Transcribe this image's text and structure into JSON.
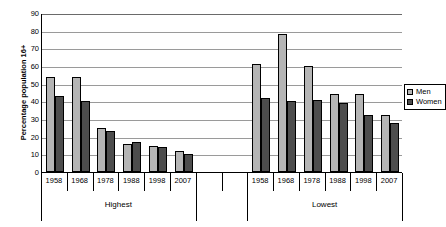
{
  "chart_data": {
    "type": "bar",
    "title": "",
    "xlabel": "",
    "ylabel": "Percentage population 16+",
    "ylim": [
      0,
      90
    ],
    "ytick_step": 10,
    "yticks": [
      0,
      10,
      20,
      30,
      40,
      50,
      60,
      70,
      80,
      90
    ],
    "grid": true,
    "legend_position": "right",
    "groups": [
      "Highest",
      "Lowest"
    ],
    "categories": [
      "1958",
      "1968",
      "1978",
      "1988",
      "1998",
      "2007"
    ],
    "series": [
      {
        "name": "Men",
        "color": "#b5b5b5",
        "values_by_group": {
          "Highest": [
            54,
            54,
            25,
            16,
            15,
            12
          ],
          "Lowest": [
            61,
            78,
            60,
            44,
            44,
            32
          ]
        }
      },
      {
        "name": "Women",
        "color": "#4d4d4d",
        "values_by_group": {
          "Highest": [
            43,
            40,
            23,
            17,
            14,
            10
          ],
          "Lowest": [
            42,
            40,
            41,
            39,
            32,
            28
          ]
        }
      }
    ]
  },
  "legend": {
    "items": [
      {
        "label": "Men",
        "color": "#b5b5b5"
      },
      {
        "label": "Women",
        "color": "#4d4d4d"
      }
    ]
  },
  "axes": {
    "y_title": "Percentage population 16+"
  }
}
